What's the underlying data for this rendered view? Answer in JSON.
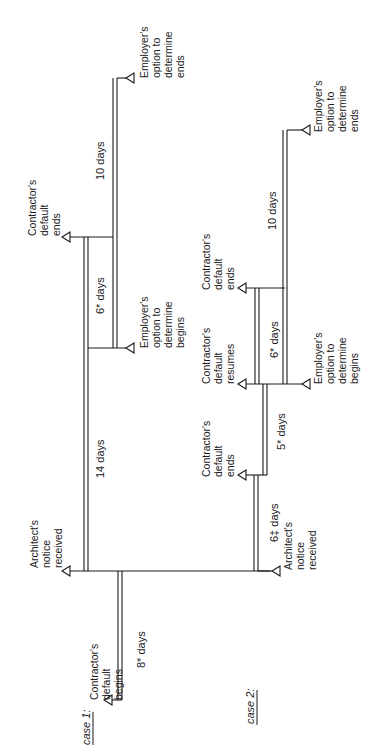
{
  "diagram": {
    "orientation": "rotated-90-ccw",
    "case1": {
      "title": "case 1:",
      "events": {
        "contractor_default_begins": [
          "Contractor's",
          "default",
          "begins"
        ],
        "architect_notice_received": [
          "Architect's",
          "notice",
          "received"
        ],
        "contractor_default_ends": [
          "Contractor's",
          "default",
          "ends"
        ],
        "employer_option_begins": [
          "Employer's",
          "option to",
          "determine",
          "begins"
        ],
        "employer_option_ends": [
          "Employer's",
          "option to",
          "determine",
          "ends"
        ]
      },
      "durations": {
        "d1": "8* days",
        "d2": "14 days",
        "d3": "6* days",
        "d4": "10 days"
      }
    },
    "case2": {
      "title": "case 2:",
      "events": {
        "architect_notice_received": [
          "Architect's",
          "notice",
          "received"
        ],
        "contractor_default_ends": [
          "Contractor's",
          "default",
          "ends"
        ],
        "contractor_default_resumes": [
          "Contractor's",
          "default",
          "resumes"
        ],
        "employer_option_begins": [
          "Employer's",
          "option to",
          "determine",
          "begins"
        ],
        "contractor_default_ends_2": [
          "Contractor's",
          "default",
          "ends"
        ],
        "employer_option_ends": [
          "Employer's",
          "option to",
          "determine",
          "ends"
        ]
      },
      "durations": {
        "d1": "6‡ days",
        "d2": "5* days",
        "d3": "6* days",
        "d4": "10 days"
      }
    }
  }
}
